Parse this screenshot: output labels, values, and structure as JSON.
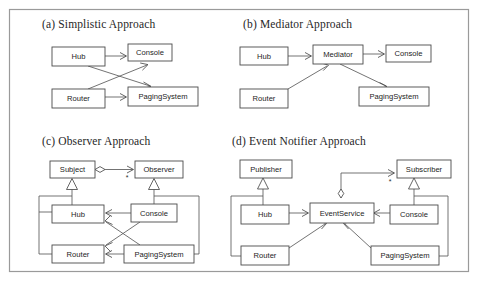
{
  "figure": {
    "kind": "uml-class-diagram-grid",
    "width": 478,
    "height": 285,
    "background_color": "#ffffff",
    "frame": {
      "x": 9,
      "y": 9,
      "width": 460,
      "height": 263,
      "stroke_color": "#9a9a9a"
    },
    "node_fill_color": "#ffffff",
    "node_stroke_color": "#4a4a4a",
    "edge_color": "#5a5a5a",
    "caption_color": "#262626"
  },
  "panels": [
    {
      "id": "a",
      "caption": "(a) Simplistic Approach",
      "caption_x": 42,
      "caption_y": 28,
      "nodes": [
        {
          "id": "hub",
          "label": "Hub",
          "x": 52,
          "y": 47,
          "w": 53,
          "h": 19
        },
        {
          "id": "console",
          "label": "Console",
          "x": 128,
          "y": 44,
          "w": 44,
          "h": 17
        },
        {
          "id": "router",
          "label": "Router",
          "x": 52,
          "y": 89,
          "w": 53,
          "h": 19
        },
        {
          "id": "paging",
          "label": "PagingSystem",
          "x": 128,
          "y": 87,
          "w": 70,
          "h": 19
        }
      ],
      "edges": [
        {
          "from": "hub",
          "to": "console",
          "kind": "association-open-arrow"
        },
        {
          "from": "hub",
          "to": "paging",
          "kind": "association-open-arrow"
        },
        {
          "from": "router",
          "to": "console",
          "kind": "association-open-arrow"
        },
        {
          "from": "router",
          "to": "paging",
          "kind": "association-open-arrow"
        }
      ]
    },
    {
      "id": "b",
      "caption": "(b) Mediator Approach",
      "caption_x": 243,
      "caption_y": 28,
      "nodes": [
        {
          "id": "hub",
          "label": "Hub",
          "x": 240,
          "y": 47,
          "w": 48,
          "h": 18
        },
        {
          "id": "mediator",
          "label": "Mediator",
          "x": 313,
          "y": 45,
          "w": 50,
          "h": 19
        },
        {
          "id": "console",
          "label": "Console",
          "x": 386,
          "y": 45,
          "w": 45,
          "h": 17
        },
        {
          "id": "router",
          "label": "Router",
          "x": 240,
          "y": 89,
          "w": 48,
          "h": 19
        },
        {
          "id": "paging",
          "label": "PagingSystem",
          "x": 359,
          "y": 87,
          "w": 70,
          "h": 19
        }
      ],
      "edges": [
        {
          "from": "hub",
          "to": "mediator",
          "kind": "association-open-arrow"
        },
        {
          "from": "router",
          "to": "mediator",
          "kind": "association-open-arrow"
        },
        {
          "from": "mediator",
          "to": "console",
          "kind": "association-open-arrow"
        },
        {
          "from": "mediator",
          "to": "paging",
          "kind": "association-open-arrow"
        }
      ]
    },
    {
      "id": "c",
      "caption": "(c) Observer Approach",
      "caption_x": 42,
      "caption_y": 145,
      "multiplicity": "*",
      "nodes": [
        {
          "id": "subject",
          "label": "Subject",
          "x": 50,
          "y": 161,
          "w": 45,
          "h": 17
        },
        {
          "id": "observer",
          "label": "Observer",
          "x": 135,
          "y": 161,
          "w": 48,
          "h": 17
        },
        {
          "id": "hub",
          "label": "Hub",
          "x": 52,
          "y": 205,
          "w": 52,
          "h": 18
        },
        {
          "id": "console",
          "label": "Console",
          "x": 131,
          "y": 204,
          "w": 46,
          "h": 18
        },
        {
          "id": "router",
          "label": "Router",
          "x": 52,
          "y": 245,
          "w": 52,
          "h": 18
        },
        {
          "id": "paging",
          "label": "PagingSystem",
          "x": 124,
          "y": 245,
          "w": 70,
          "h": 18
        }
      ],
      "edges": [
        {
          "from": "subject",
          "to": "observer",
          "kind": "aggregation-open-arrow"
        },
        {
          "from": "hub",
          "to": "subject",
          "kind": "generalization"
        },
        {
          "from": "console",
          "to": "observer",
          "kind": "generalization"
        },
        {
          "from": "paging",
          "to": "observer",
          "kind": "generalization-routed"
        },
        {
          "from": "console",
          "to": "hub",
          "kind": "association-open-arrow"
        },
        {
          "from": "console",
          "to": "router",
          "kind": "association-open-arrow"
        },
        {
          "from": "paging",
          "to": "hub",
          "kind": "association-open-arrow"
        },
        {
          "from": "paging",
          "to": "router",
          "kind": "association-open-arrow"
        },
        {
          "from": "hub",
          "to": "subject",
          "kind": "routed-left"
        },
        {
          "from": "router",
          "to": "subject",
          "kind": "routed-left"
        }
      ]
    },
    {
      "id": "d",
      "caption": "(d) Event Notifier Approach",
      "caption_x": 232,
      "caption_y": 145,
      "multiplicity": "*",
      "nodes": [
        {
          "id": "publisher",
          "label": "Publisher",
          "x": 240,
          "y": 160,
          "w": 52,
          "h": 18
        },
        {
          "id": "subscriber",
          "label": "Subscriber",
          "x": 397,
          "y": 160,
          "w": 54,
          "h": 18
        },
        {
          "id": "hub",
          "label": "Hub",
          "x": 241,
          "y": 205,
          "w": 48,
          "h": 19
        },
        {
          "id": "eventsvc",
          "label": "EventService",
          "x": 310,
          "y": 203,
          "w": 62,
          "h": 20
        },
        {
          "id": "console",
          "label": "Console",
          "x": 390,
          "y": 205,
          "w": 48,
          "h": 19
        },
        {
          "id": "router",
          "label": "Router",
          "x": 241,
          "y": 246,
          "w": 48,
          "h": 19
        },
        {
          "id": "paging",
          "label": "PagingSystem",
          "x": 371,
          "y": 246,
          "w": 68,
          "h": 19
        }
      ],
      "edges": [
        {
          "from": "hub",
          "to": "publisher",
          "kind": "generalization"
        },
        {
          "from": "console",
          "to": "subscriber",
          "kind": "generalization"
        },
        {
          "from": "router",
          "to": "publisher",
          "kind": "routed-left"
        },
        {
          "from": "paging",
          "to": "subscriber",
          "kind": "routed-right"
        },
        {
          "from": "eventsvc",
          "to": "subscriber",
          "kind": "aggregation-open-arrow"
        },
        {
          "from": "hub",
          "to": "eventsvc",
          "kind": "association-open-arrow"
        },
        {
          "from": "router",
          "to": "eventsvc",
          "kind": "association-open-arrow"
        },
        {
          "from": "console",
          "to": "eventsvc",
          "kind": "association-open-arrow"
        },
        {
          "from": "paging",
          "to": "eventsvc",
          "kind": "association-open-arrow"
        }
      ]
    }
  ]
}
